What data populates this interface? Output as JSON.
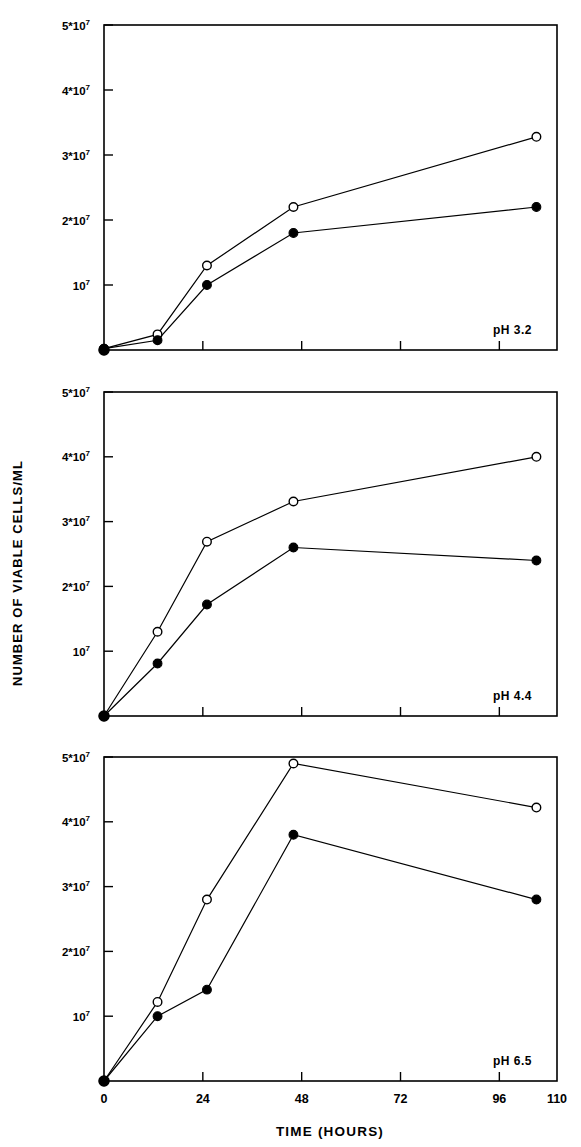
{
  "figure": {
    "x_axis_title": "TIME (HOURS)",
    "y_axis_title": "NUMBER OF VIABLE CELLS/ML",
    "x_ticks": [
      "0",
      "24",
      "48",
      "72",
      "96",
      "110"
    ],
    "y_ticks": [
      {
        "mantissa": "5*10",
        "exponent": "7"
      },
      {
        "mantissa": "4*10",
        "exponent": "7"
      },
      {
        "mantissa": "3*10",
        "exponent": "7"
      },
      {
        "mantissa": "2*10",
        "exponent": "7"
      },
      {
        "mantissa": "10",
        "exponent": "7"
      }
    ],
    "panel_labels": [
      "pH 3.2",
      "pH 4.4",
      "pH 6.5"
    ]
  },
  "chart_data": [
    {
      "type": "line",
      "title": "pH 3.2",
      "xlabel": "TIME (HOURS)",
      "ylabel": "NUMBER OF VIABLE CELLS/ML",
      "xlim": [
        0,
        110
      ],
      "ylim": [
        0,
        50000000
      ],
      "xticks": [
        0,
        24,
        48,
        72,
        96,
        110
      ],
      "yticks": [
        10000000,
        20000000,
        30000000,
        40000000,
        50000000
      ],
      "grid": false,
      "legend": "none",
      "series": [
        {
          "name": "open-circle",
          "marker": "open circle",
          "x": [
            0,
            13,
            25,
            46,
            105
          ],
          "values": [
            200000,
            2400000,
            13000000,
            22000000,
            32800000
          ]
        },
        {
          "name": "filled-circle",
          "marker": "filled circle",
          "x": [
            0,
            13,
            25,
            46,
            105
          ],
          "values": [
            200000,
            1500000,
            10000000,
            18000000,
            22000000
          ]
        }
      ]
    },
    {
      "type": "line",
      "title": "pH 4.4",
      "xlabel": "TIME (HOURS)",
      "ylabel": "NUMBER OF VIABLE CELLS/ML",
      "xlim": [
        0,
        110
      ],
      "ylim": [
        0,
        50000000
      ],
      "xticks": [
        0,
        24,
        48,
        72,
        96,
        110
      ],
      "yticks": [
        10000000,
        20000000,
        30000000,
        40000000,
        50000000
      ],
      "grid": false,
      "legend": "none",
      "series": [
        {
          "name": "open-circle",
          "marker": "open circle",
          "x": [
            0,
            13,
            25,
            46,
            105
          ],
          "values": [
            0,
            13000000,
            26900000,
            33100000,
            40000000
          ]
        },
        {
          "name": "filled-circle",
          "marker": "filled circle",
          "x": [
            0,
            13,
            25,
            46,
            105
          ],
          "values": [
            0,
            8100000,
            17200000,
            26000000,
            24000000
          ]
        }
      ]
    },
    {
      "type": "line",
      "title": "pH 6.5",
      "xlabel": "TIME (HOURS)",
      "ylabel": "NUMBER OF VIABLE CELLS/ML",
      "xlim": [
        0,
        110
      ],
      "ylim": [
        0,
        50000000
      ],
      "xticks": [
        0,
        24,
        48,
        72,
        96,
        110
      ],
      "yticks": [
        10000000,
        20000000,
        30000000,
        40000000,
        50000000
      ],
      "grid": false,
      "legend": "none",
      "series": [
        {
          "name": "open-circle",
          "marker": "open circle",
          "x": [
            0,
            13,
            25,
            46,
            105
          ],
          "values": [
            0,
            12200000,
            28000000,
            49000000,
            42200000
          ]
        },
        {
          "name": "filled-circle",
          "marker": "filled circle",
          "x": [
            0,
            13,
            25,
            46,
            105
          ],
          "values": [
            0,
            10000000,
            14100000,
            38000000,
            28000000
          ]
        }
      ]
    }
  ]
}
